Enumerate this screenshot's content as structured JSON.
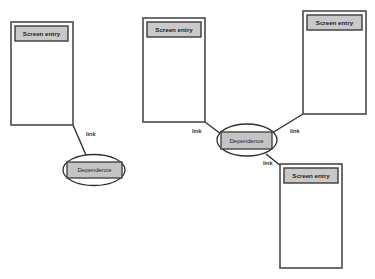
{
  "diagram": {
    "colors": {
      "box_stroke": "#4a4a4a",
      "label_fill": "#c9c9c9",
      "ellipse_stroke": "#2e2e2e",
      "line": "#2e2e2e",
      "background": "#ffffff"
    },
    "screen_entries": [
      {
        "id": "screen-entry-1",
        "label": "Screen entry"
      },
      {
        "id": "screen-entry-2",
        "label": "Screen entry"
      },
      {
        "id": "screen-entry-3",
        "label": "Screen entry"
      },
      {
        "id": "screen-entry-4",
        "label": "Screen entry"
      }
    ],
    "dependences": [
      {
        "id": "dependence-1",
        "label": "Dependence"
      },
      {
        "id": "dependence-2",
        "label": "Dependence"
      }
    ],
    "links": [
      {
        "from": "screen-entry-1",
        "to": "dependence-1",
        "label": "link"
      },
      {
        "from": "screen-entry-2",
        "to": "dependence-2",
        "label": "link"
      },
      {
        "from": "screen-entry-3",
        "to": "dependence-2",
        "label": "link"
      },
      {
        "from": "dependence-2",
        "to": "screen-entry-4",
        "label": "link"
      }
    ]
  }
}
